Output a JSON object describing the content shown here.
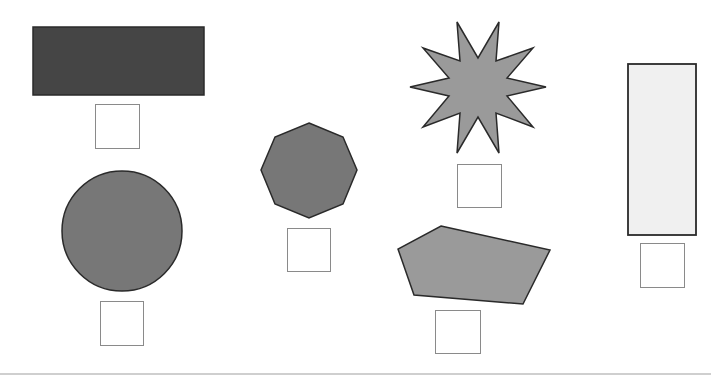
{
  "colors": {
    "background": "#ffffff",
    "outline": "#333333",
    "box_border": "#8a8a8a",
    "dark_fill": "#454545",
    "medium_fill": "#777777",
    "light_medium_fill": "#9a9a9a",
    "light_fill": "#f0f0f0"
  },
  "shapes": [
    {
      "name": "wide-rectangle",
      "type": "rectangle",
      "fill": "#454545",
      "x": 33,
      "y": 27,
      "w": 171,
      "h": 68
    },
    {
      "name": "circle",
      "type": "circle",
      "fill": "#777777",
      "cx": 122,
      "cy": 231,
      "r": 60
    },
    {
      "name": "octagon",
      "type": "polygon",
      "fill": "#777777",
      "points": "309,123 343,137 357,170 343,204 309,218 275,204 261,170 275,137"
    },
    {
      "name": "ten-point-star",
      "type": "polygon",
      "fill": "#9a9a9a",
      "points": "457,22 478,58 499,22 496,61 533,48 507,78 546,87 507,96 533,127 496,113 499,153 478,117 457,153 460,113 423,127 449,96 410,87 449,78 423,48 460,61"
    },
    {
      "name": "pentagon",
      "type": "polygon",
      "fill": "#9a9a9a",
      "points": "441,226 550,250 523,304 414,295 398,249"
    },
    {
      "name": "tall-rectangle",
      "type": "rectangle",
      "fill": "#f0f0f0",
      "x": 628,
      "y": 64,
      "w": 68,
      "h": 171
    }
  ],
  "answer_boxes": [
    {
      "for": "wide-rectangle",
      "x": 95,
      "y": 104,
      "w": 45,
      "h": 45
    },
    {
      "for": "circle",
      "x": 100,
      "y": 301,
      "w": 44,
      "h": 45
    },
    {
      "for": "octagon",
      "x": 287,
      "y": 228,
      "w": 44,
      "h": 44
    },
    {
      "for": "ten-point-star",
      "x": 457,
      "y": 164,
      "w": 45,
      "h": 44
    },
    {
      "for": "pentagon",
      "x": 435,
      "y": 310,
      "w": 46,
      "h": 44
    },
    {
      "for": "tall-rectangle",
      "x": 640,
      "y": 243,
      "w": 45,
      "h": 45
    }
  ]
}
